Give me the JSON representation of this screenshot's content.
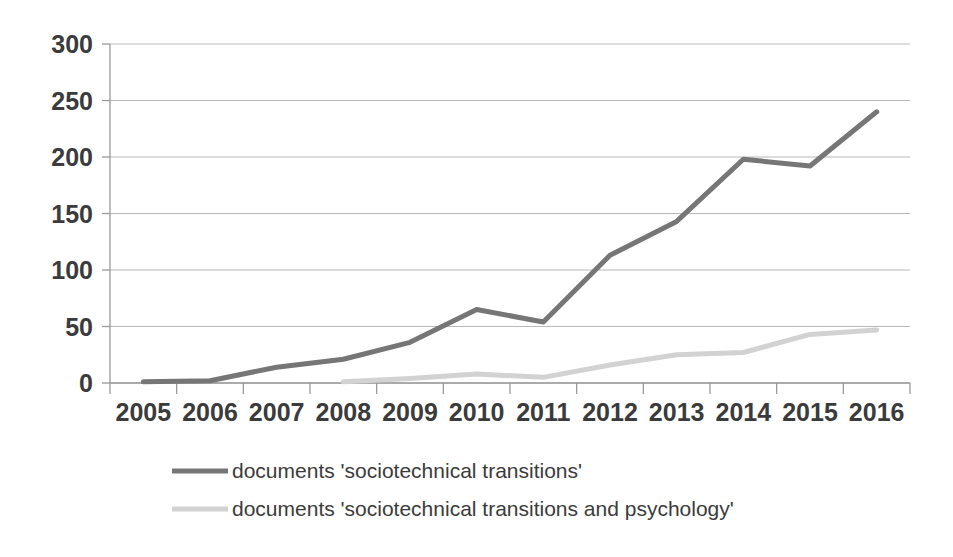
{
  "chart_data": {
    "type": "line",
    "title": "",
    "subtitle": "",
    "xlabel": "",
    "ylabel": "",
    "categories": [
      "2005",
      "2006",
      "2007",
      "2008",
      "2009",
      "2010",
      "2011",
      "2012",
      "2013",
      "2014",
      "2015",
      "2016"
    ],
    "ylim": [
      0,
      300
    ],
    "yticks": [
      0,
      50,
      100,
      150,
      200,
      250,
      300
    ],
    "ytick_labels": [
      "0",
      "50",
      "100",
      "150",
      "200",
      "250",
      "300"
    ],
    "grid": true,
    "legend_position": "bottom",
    "series": [
      {
        "name": "documents  'sociotechnical transitions'",
        "color": "#767676",
        "width": 5,
        "values": [
          1,
          2,
          14,
          21,
          36,
          65,
          54,
          113,
          143,
          198,
          192,
          240
        ]
      },
      {
        "name": "documents  'sociotechnical transitions and psychology'",
        "color": "#d2d2d2",
        "width": 5,
        "values": [
          null,
          null,
          null,
          1,
          4,
          8,
          5,
          16,
          25,
          27,
          43,
          47
        ]
      }
    ]
  },
  "legend": {
    "items": [
      {
        "label": "documents  'sociotechnical transitions'",
        "color": "#767676"
      },
      {
        "label": "documents  'sociotechnical transitions and psychology'",
        "color": "#d2d2d2"
      }
    ]
  },
  "plot_geometry": {
    "left": 110,
    "right": 910,
    "top": 44,
    "bottom": 383,
    "legend_swatch_x": 172,
    "legend_swatch_width": 56,
    "legend_text_x": 232,
    "legend_row1_y": 478,
    "legend_row2_y": 516
  }
}
